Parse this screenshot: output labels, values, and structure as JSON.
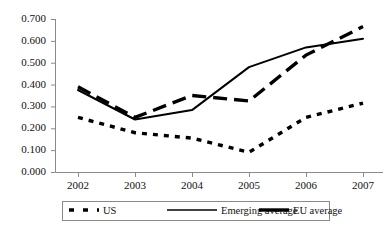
{
  "chart_data": {
    "type": "line",
    "title": "",
    "subtitle": "",
    "xlabel": "",
    "ylabel": "",
    "x": [
      "2002",
      "2003",
      "2004",
      "2005",
      "2006",
      "2007"
    ],
    "categories": [
      "2002",
      "2003",
      "2004",
      "2005",
      "2006",
      "2007"
    ],
    "series": [
      {
        "name": "US",
        "style": "dotted",
        "color": "#000000",
        "values": [
          0.25,
          0.18,
          0.155,
          0.09,
          0.25,
          0.315
        ]
      },
      {
        "name": "Emerging average",
        "style": "solid",
        "color": "#000000",
        "values": [
          0.375,
          0.24,
          0.283,
          0.48,
          0.57,
          0.61
        ]
      },
      {
        "name": "EU average",
        "style": "dashed",
        "color": "#000000",
        "values": [
          0.39,
          0.25,
          0.35,
          0.325,
          0.535,
          0.665
        ]
      }
    ],
    "ylim": [
      0.0,
      0.7
    ],
    "ytick_values": [
      0.0,
      0.1,
      0.2,
      0.3,
      0.4,
      0.5,
      0.6,
      0.7
    ],
    "ytick_labels": [
      "0.000",
      "0.100",
      "0.200",
      "0.300",
      "0.400",
      "0.500",
      "0.600",
      "0.700"
    ],
    "xtick_labels": [
      "2002",
      "2003",
      "2004",
      "2005",
      "2006",
      "2007"
    ],
    "grid": false,
    "legend_position": "bottom",
    "legend_entries": [
      {
        "label": "US",
        "style": "dotted"
      },
      {
        "label": "Emerging average",
        "style": "solid"
      },
      {
        "label": "EU average",
        "style": "dashed"
      }
    ],
    "axis_color": "#8a8a8a",
    "line_color": "#000000"
  }
}
